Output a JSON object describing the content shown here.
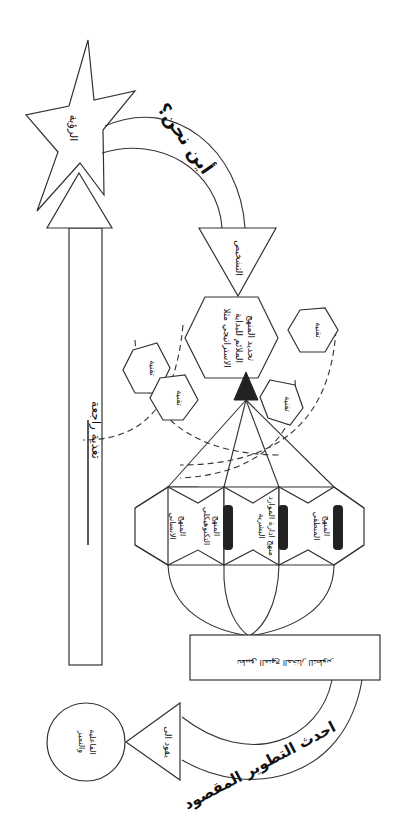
{
  "diagram": {
    "vision_star": {
      "label": "الرؤية"
    },
    "top_arch": {
      "label": "أين نحن؟"
    },
    "diagnosis_triangle": {
      "label": "التشخيص"
    },
    "center_hexagon": {
      "line1": "تحديد المنهج",
      "line2": "الملائم للبداية",
      "line3": "الاستراتيجي مثلا"
    },
    "technique_hexagons": [
      {
        "label": "تقنية"
      },
      {
        "label": "تقنية"
      },
      {
        "label": "تقنية"
      },
      {
        "label": "تقنية"
      }
    ],
    "approach_hexagons": [
      {
        "line1": "المنهج",
        "line2": "الانساني"
      },
      {
        "line1": "المنهج",
        "line2": "التكنوهيكلي"
      },
      {
        "line1": "منهج ادارة الموارد",
        "line2": "البشرية"
      },
      {
        "line1": "المنهج",
        "line2": "المنطقي"
      }
    ],
    "implementation_box": {
      "label": "تطبيق المنهج المختار للتطوير"
    },
    "bottom_arch": {
      "label": "احدث التطوير المقصود"
    },
    "leads_to_triangle": {
      "label": "يقود الى"
    },
    "outcome_circle": {
      "line1": "الفاعلية",
      "line2": "والتميز"
    },
    "feedback_bar": {
      "label": "تغذية راجعة"
    },
    "colors": {
      "stroke": "#333333",
      "fill": "#ffffff",
      "dark_bar": "#222222"
    }
  }
}
